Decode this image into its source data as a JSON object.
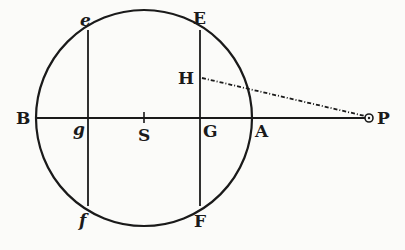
{
  "diagram": {
    "colors": {
      "ink": "#1a1a1a",
      "paper": "#fbfbf9"
    },
    "circle": {
      "center": "S",
      "cx": 144,
      "cy": 118,
      "r": 108
    },
    "axis": {
      "from": "B",
      "to": "P",
      "y": 118
    },
    "chords": [
      {
        "name": "ef",
        "x": 88,
        "top": "e",
        "bottom": "f"
      },
      {
        "name": "EF",
        "x": 200,
        "top": "E",
        "bottom": "F"
      }
    ],
    "dashed_line": {
      "from": "H",
      "to": "P"
    },
    "labels": {
      "e": "e",
      "E": "E",
      "H": "H",
      "B": "B",
      "g": "g",
      "S": "S",
      "G": "G",
      "A": "A",
      "P": "P",
      "f": "f",
      "F": "F"
    }
  }
}
